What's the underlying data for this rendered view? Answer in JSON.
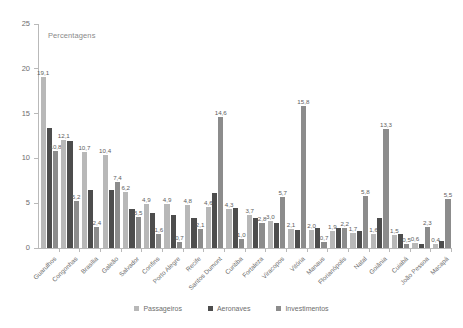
{
  "chart_data": {
    "type": "bar",
    "title": "",
    "note": "Percentagens",
    "xlabel": "",
    "ylabel": "",
    "ylim": [
      0,
      25
    ],
    "yticks": [
      0,
      5,
      10,
      15,
      20,
      25
    ],
    "grid": false,
    "legend_position": "bottom",
    "categories": [
      "Guarulhos",
      "Congonhas",
      "Brasília",
      "Galeão",
      "Salvador",
      "Confins",
      "Porto Alegre",
      "Recife",
      "Santos Dumont",
      "Curitiba",
      "Fortaleza",
      "Viracopos",
      "Vitória",
      "Manaus",
      "Florianópolis",
      "Natal",
      "Goiânia",
      "Cuiabá",
      "João Pessoa",
      "Macapá"
    ],
    "series": [
      {
        "name": "Passageiros",
        "color": "#b8b8b8",
        "values": [
          19.1,
          12.1,
          10.7,
          10.4,
          6.2,
          4.9,
          4.9,
          4.8,
          4.6,
          4.3,
          3.7,
          3.0,
          2.1,
          2.0,
          1.9,
          1.7,
          1.6,
          1.5,
          0.6,
          0.4
        ]
      },
      {
        "name": "Aeronaves",
        "color": "#4d4d4d",
        "values": [
          13.4,
          11.9,
          6.5,
          6.5,
          4.3,
          3.9,
          3.7,
          3.4,
          6.1,
          4.5,
          3.4,
          2.8,
          2.0,
          2.2,
          2.2,
          1.9,
          3.4,
          1.6,
          0.5,
          0.8
        ]
      },
      {
        "name": "Investimentos",
        "color": "#8c8c8c",
        "values": [
          10.8,
          5.2,
          2.4,
          7.4,
          3.5,
          1.6,
          0.7,
          2.1,
          14.6,
          1.0,
          2.8,
          5.7,
          15.8,
          0.7,
          2.2,
          5.8,
          13.3,
          0.5,
          2.3,
          5.5
        ]
      }
    ],
    "labels": [
      {
        "category": "Guarulhos",
        "series": "Passageiros",
        "text": "19,1"
      },
      {
        "category": "Guarulhos",
        "series": "Investimentos",
        "text": "10,8"
      },
      {
        "category": "Congonhas",
        "series": "Passageiros",
        "text": "12,1"
      },
      {
        "category": "Congonhas",
        "series": "Investimentos",
        "text": "5,2"
      },
      {
        "category": "Brasília",
        "series": "Passageiros",
        "text": "10,7"
      },
      {
        "category": "Brasília",
        "series": "Investimentos",
        "text": "2,4"
      },
      {
        "category": "Galeão",
        "series": "Passageiros",
        "text": "10,4"
      },
      {
        "category": "Galeão",
        "series": "Investimentos",
        "text": "7,4"
      },
      {
        "category": "Salvador",
        "series": "Passageiros",
        "text": "6,2"
      },
      {
        "category": "Salvador",
        "series": "Investimentos",
        "text": "3,5"
      },
      {
        "category": "Confins",
        "series": "Passageiros",
        "text": "4,9"
      },
      {
        "category": "Confins",
        "series": "Investimentos",
        "text": "1,6"
      },
      {
        "category": "Porto Alegre",
        "series": "Passageiros",
        "text": "4,9"
      },
      {
        "category": "Porto Alegre",
        "series": "Investimentos",
        "text": "0,7"
      },
      {
        "category": "Recife",
        "series": "Passageiros",
        "text": "4,8"
      },
      {
        "category": "Recife",
        "series": "Investimentos",
        "text": "2,1"
      },
      {
        "category": "Santos Dumont",
        "series": "Passageiros",
        "text": "4,6"
      },
      {
        "category": "Santos Dumont",
        "series": "Investimentos",
        "text": "14,6"
      },
      {
        "category": "Curitiba",
        "series": "Passageiros",
        "text": "4,3"
      },
      {
        "category": "Curitiba",
        "series": "Investimentos",
        "text": "1,0"
      },
      {
        "category": "Fortaleza",
        "series": "Passageiros",
        "text": "3,7"
      },
      {
        "category": "Fortaleza",
        "series": "Investimentos",
        "text": "2,8"
      },
      {
        "category": "Viracopos",
        "series": "Passageiros",
        "text": "3,0"
      },
      {
        "category": "Viracopos",
        "series": "Investimentos",
        "text": "5,7"
      },
      {
        "category": "Vitória",
        "series": "Passageiros",
        "text": "2,1"
      },
      {
        "category": "Vitória",
        "series": "Investimentos",
        "text": "15,8"
      },
      {
        "category": "Manaus",
        "series": "Passageiros",
        "text": "2,0"
      },
      {
        "category": "Manaus",
        "series": "Investimentos",
        "text": "0,7"
      },
      {
        "category": "Florianópolis",
        "series": "Passageiros",
        "text": "1,9"
      },
      {
        "category": "Florianópolis",
        "series": "Investimentos",
        "text": "2,2"
      },
      {
        "category": "Natal",
        "series": "Passageiros",
        "text": "1,7"
      },
      {
        "category": "Natal",
        "series": "Investimentos",
        "text": "5,8"
      },
      {
        "category": "Goiânia",
        "series": "Passageiros",
        "text": "1,6"
      },
      {
        "category": "Goiânia",
        "series": "Investimentos",
        "text": "13,3"
      },
      {
        "category": "Cuiabá",
        "series": "Passageiros",
        "text": "1,5"
      },
      {
        "category": "Cuiabá",
        "series": "Investimentos",
        "text": "0,5"
      },
      {
        "category": "João Pessoa",
        "series": "Passageiros",
        "text": "0,6"
      },
      {
        "category": "João Pessoa",
        "series": "Investimentos",
        "text": "2,3"
      },
      {
        "category": "Macapá",
        "series": "Passageiros",
        "text": "0,4"
      },
      {
        "category": "Macapá",
        "series": "Investimentos",
        "text": "5,5"
      }
    ]
  }
}
